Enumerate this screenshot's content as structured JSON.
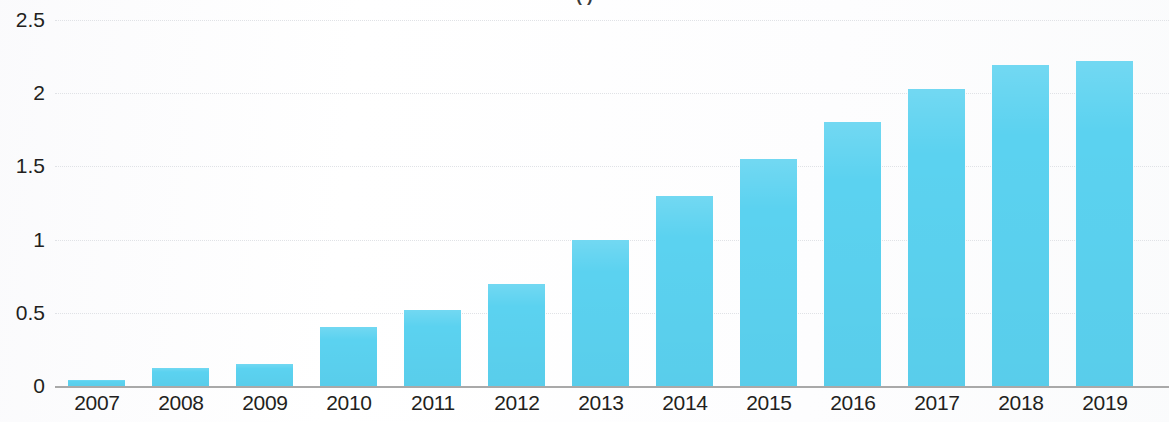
{
  "chart_data": {
    "type": "bar",
    "title": "( )",
    "title_note": "title is cropped off the top edge of the screenshot; only fragments of parentheses are visible",
    "subtitle": "",
    "xlabel": "",
    "ylabel": "",
    "categories": [
      "2007",
      "2008",
      "2009",
      "2010",
      "2011",
      "2012",
      "2013",
      "2014",
      "2015",
      "2016",
      "2017",
      "2018",
      "2019"
    ],
    "values": [
      0.04,
      0.12,
      0.15,
      0.4,
      0.52,
      0.7,
      1.0,
      1.3,
      1.55,
      1.8,
      2.03,
      2.19,
      2.22
    ],
    "series": [
      {
        "name": "",
        "values": [
          0.04,
          0.12,
          0.15,
          0.4,
          0.52,
          0.7,
          1.0,
          1.3,
          1.55,
          1.8,
          2.03,
          2.19,
          2.22
        ],
        "color": "#5bd2f0"
      }
    ],
    "ylim": [
      0,
      2.5
    ],
    "yticks": [
      0,
      0.5,
      1,
      1.5,
      2,
      2.5
    ],
    "ytick_labels": [
      "0",
      "0.5",
      "1",
      "1.5",
      "2",
      "2.5"
    ],
    "grid": true,
    "grid_style": "dotted",
    "grid_color": "#dfe1e5",
    "baseline_color": "#9a9a9a",
    "legend": false,
    "legend_position": "none",
    "bar_color": "#5bd2f0",
    "background": "#ffffff",
    "text_color": "#231f20",
    "data_labels": false,
    "annotations": []
  },
  "axis": {
    "y_tick_labels": [
      "2.5",
      "2",
      "1.5",
      "1",
      "0.5",
      "0"
    ],
    "x_tick_labels": [
      "2007",
      "2008",
      "2009",
      "2010",
      "2011",
      "2012",
      "2013",
      "2014",
      "2015",
      "2016",
      "2017",
      "2018",
      "2019"
    ]
  }
}
